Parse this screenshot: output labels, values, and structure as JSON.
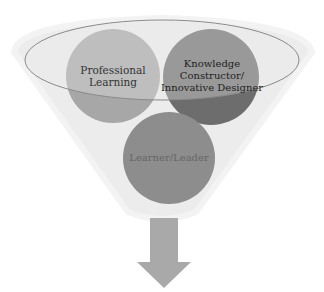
{
  "diagram": {
    "type": "funnel",
    "colors": {
      "funnel": "#ececec",
      "funnel_edge": "#f4f4f4",
      "ellipse_stroke": "#8a8a8a",
      "circle_professional": "#a7a7a7",
      "circle_knowledge": "#6d6d6d",
      "circle_learner": "#8d8d8d",
      "arrow": "#a9a9a9",
      "text_dark": "#333333",
      "text_muted": "#666666"
    },
    "circles": [
      {
        "id": "professional-learning",
        "lines": [
          "Professional",
          "Learning"
        ]
      },
      {
        "id": "knowledge-constructor",
        "lines": [
          "Knowledge",
          "Constructor/",
          "Innovative Designer"
        ]
      },
      {
        "id": "learner-leader",
        "lines": [
          "Learner/Leader"
        ]
      }
    ],
    "arrow_icon": "down-arrow-icon"
  }
}
